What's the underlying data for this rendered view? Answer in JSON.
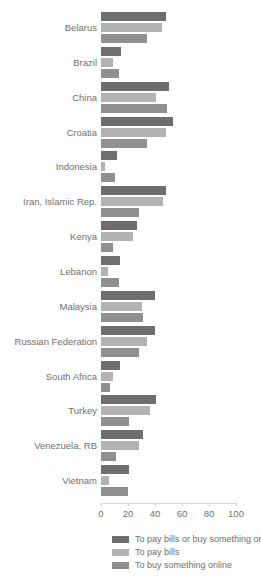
{
  "chart_data": {
    "type": "bar",
    "orientation": "horizontal",
    "title": "",
    "xlabel": "",
    "ylabel": "",
    "xlim": [
      0,
      100
    ],
    "xticks": [
      0,
      20,
      40,
      60,
      80,
      100
    ],
    "grid": false,
    "legend_position": "bottom",
    "categories": [
      "Belarus",
      "Brazil",
      "China",
      "Croatia",
      "Indonesia",
      "Iran, Islamic Rep.",
      "Kenya",
      "Lebanon",
      "Malaysia",
      "Russian Federation",
      "South Africa",
      "Turkey",
      "Venezuela, RB",
      "Vietnam"
    ],
    "series": [
      {
        "name": "To pay bills or buy something online",
        "color": "#6e6e6e",
        "values": [
          48,
          15,
          50,
          53,
          12,
          48,
          27,
          14,
          40,
          40,
          14,
          41,
          31,
          21
        ]
      },
      {
        "name": "To pay bills",
        "color": "#b3b3b3",
        "values": [
          45,
          9,
          41,
          48,
          3,
          46,
          24,
          5,
          30,
          34,
          9,
          36,
          28,
          6
        ]
      },
      {
        "name": "To buy something online",
        "color": "#909090",
        "values": [
          34,
          13,
          49,
          34,
          10,
          28,
          9,
          13,
          31,
          28,
          7,
          21,
          11,
          20
        ]
      }
    ]
  },
  "legend": {
    "items": [
      {
        "label": "To pay bills or buy something online",
        "color": "#6e6e6e"
      },
      {
        "label": "To pay bills",
        "color": "#b3b3b3"
      },
      {
        "label": "To buy something online",
        "color": "#909090"
      }
    ]
  },
  "axis": {
    "tick_labels": [
      "0",
      "20",
      "40",
      "60",
      "80",
      "100"
    ]
  }
}
